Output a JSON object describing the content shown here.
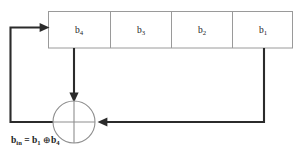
{
  "diagram": {
    "type": "block-diagram",
    "colors": {
      "background": "#ffffff",
      "signal_line": "#2b2b2b",
      "box_outline": "#9a9a9a",
      "xor_outline": "#8e8e8e",
      "text": "#1c1c1c"
    },
    "register": {
      "name": "shift-register",
      "cell_count": 4,
      "order": "left-to-right",
      "cells": [
        {
          "base": "b",
          "subscript": "4",
          "label": "b4",
          "position": 1
        },
        {
          "base": "b",
          "subscript": "3",
          "label": "b3",
          "position": 2
        },
        {
          "base": "b",
          "subscript": "2",
          "label": "b2",
          "position": 3
        },
        {
          "base": "b",
          "subscript": "1",
          "label": "b1",
          "position": 4
        }
      ]
    },
    "xor_gate": {
      "name": "xor-gate",
      "symbol": "⊕",
      "inputs": [
        "b4",
        "b1"
      ],
      "output": "b_in"
    },
    "equation": {
      "lhs_base": "b",
      "lhs_subscript": "in",
      "equals": "=",
      "operand_1_base": "b",
      "operand_1_subscript": "1",
      "operator": "⊕",
      "operand_2_base": "b",
      "operand_2_subscript": "4",
      "full_text": "b_in = b1 ⊕ b4"
    },
    "connections": [
      {
        "name": "tap-b4-to-xor",
        "from": "b4",
        "to": "xor-gate",
        "arrow": "down"
      },
      {
        "name": "tap-b1-to-xor",
        "from": "b1",
        "to": "xor-gate",
        "arrow": "left"
      },
      {
        "name": "feedback-xor-to-b4",
        "from": "xor-gate",
        "to": "b4",
        "arrow": "right"
      }
    ]
  }
}
